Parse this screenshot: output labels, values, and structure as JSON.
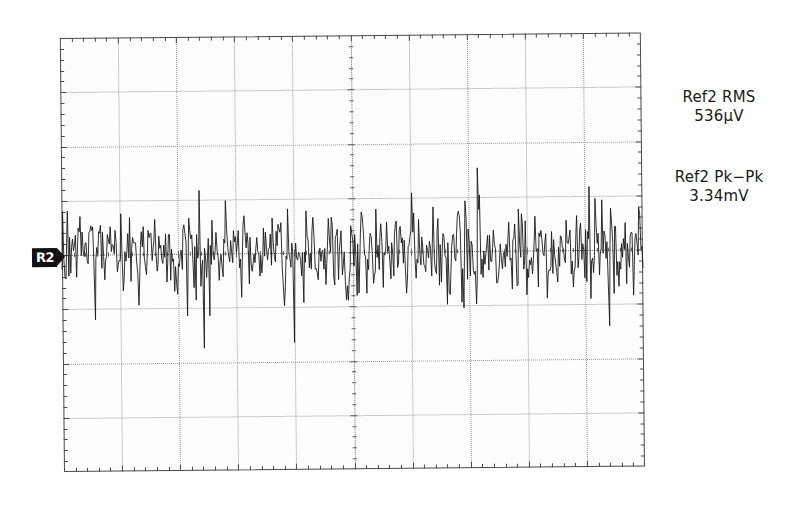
{
  "instrument": {
    "type": "oscilloscope-screen-capture",
    "channel_marker": {
      "label": "R2",
      "name": "ref2-ground-marker"
    }
  },
  "graticule": {
    "horizontal_divisions": 10,
    "vertical_divisions": 8,
    "border_color": "#4a4a4a",
    "grid_color": "#9a9a9a",
    "background_color": "#fdfdfd",
    "trace_color": "#1a1a1a"
  },
  "measurements": [
    {
      "id": "ref2-rms",
      "label": "Ref2 RMS",
      "value": "536µV"
    },
    {
      "id": "ref2-pk-pk",
      "label": "Ref2 Pk−Pk",
      "value": "3.34mV"
    }
  ],
  "chart_data": {
    "type": "line",
    "title": "",
    "xlabel": "",
    "ylabel": "",
    "grid": true,
    "legend": null,
    "x": {
      "unit": "division",
      "range": [
        0,
        10
      ],
      "samples": 600
    },
    "y": {
      "unit": "division",
      "range": [
        -4,
        4
      ],
      "zero_level_division": 0
    },
    "statistics": {
      "rms": "536µV",
      "pk_pk": "3.34mV"
    },
    "series": [
      {
        "name": "Ref2",
        "kind": "random-noise",
        "color": "#1a1a1a",
        "mean_division": 0,
        "approx_rms_divisions": 0.42,
        "approx_pk_pk_divisions": 2.6,
        "values": [
          0.05,
          -0.31,
          0.42,
          -0.18,
          0.63,
          -0.52,
          0.21,
          0.38,
          -0.44,
          0.11,
          0.57,
          -0.26,
          -0.61,
          0.34,
          0.18,
          -0.39,
          0.72,
          -0.15,
          0.29,
          -0.48,
          0.41,
          0.08,
          -0.55,
          0.63,
          -0.22,
          0.36,
          -0.67,
          0.14,
          0.49,
          -0.33,
          0.26,
          -0.58,
          0.71,
          -0.12,
          0.39,
          0.17,
          -0.46,
          0.54,
          -0.29,
          0.08,
          -0.74,
          0.31,
          0.62,
          -0.19,
          0.45,
          -0.51,
          0.23,
          0.68,
          -0.37,
          0.12,
          -0.88,
          0.41,
          -0.24,
          0.57,
          0.19,
          -0.63,
          0.35,
          0.48,
          -0.16,
          -0.42,
          0.74,
          -0.28,
          0.13,
          0.52,
          -0.69,
          0.31,
          -0.21,
          0.66,
          -0.44,
          0.27,
          0.09,
          -0.57,
          0.83,
          -0.35,
          0.18,
          0.46,
          -0.72,
          0.24,
          0.61,
          -0.13,
          -0.49,
          0.38,
          0.15,
          -0.66,
          0.52,
          -0.27,
          0.71,
          0.06,
          -0.41,
          0.33,
          -0.58,
          0.24,
          0.49,
          -0.17,
          0.65,
          -0.36,
          0.11,
          0.43,
          -0.62,
          0.28,
          0.56,
          -0.21,
          -0.47,
          0.69,
          0.14,
          -0.33,
          0.41,
          -0.75,
          0.22,
          0.58,
          -0.19,
          0.36,
          0.07,
          -0.54,
          0.63,
          -0.31,
          0.47,
          0.18,
          -0.68,
          0.25,
          0.91,
          -0.42,
          0.13,
          0.57,
          -0.26,
          -0.61,
          0.34,
          0.72,
          -0.15,
          0.29,
          -0.48,
          0.41,
          0.08,
          -0.55,
          0.66,
          -0.22,
          0.36,
          -0.71,
          0.14,
          0.49,
          -0.33,
          0.26,
          -0.58,
          0.77,
          -0.12,
          0.39,
          0.17,
          -0.46,
          0.54,
          -0.29,
          0.08,
          -0.64,
          0.31,
          0.62,
          -0.19,
          0.45,
          -0.51,
          0.23,
          0.68,
          -0.37,
          0.12,
          -0.82,
          0.41,
          -0.24,
          0.57,
          0.19,
          -0.63,
          0.35,
          0.48,
          -0.16,
          -0.42,
          0.74,
          -0.28,
          0.13,
          0.52,
          -0.69,
          0.31,
          -0.21,
          0.66,
          -0.44,
          0.27,
          0.09,
          -0.57,
          0.88,
          -0.35,
          0.18,
          0.46,
          -1.18,
          0.24,
          0.61,
          -0.13,
          -0.49,
          0.38,
          0.15,
          -0.66,
          0.52,
          -0.27,
          0.71,
          0.06,
          -0.41
        ]
      }
    ]
  }
}
